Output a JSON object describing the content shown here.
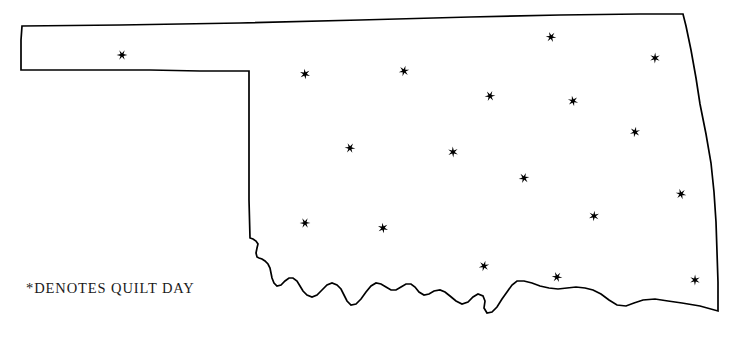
{
  "map": {
    "title": "Oklahoma Quilt Day Map",
    "state_name": "Oklahoma",
    "outline_color": "#000000",
    "background_color": "#ffffff",
    "marker_symbol": "*",
    "marker_color": "#000000",
    "marker_count": 18,
    "markers": [
      {
        "label": "quilt-day-site-1",
        "x": 122,
        "y": 55,
        "region": "panhandle"
      },
      {
        "label": "quilt-day-site-2",
        "x": 305,
        "y": 74,
        "region": "northwest"
      },
      {
        "label": "quilt-day-site-3",
        "x": 404,
        "y": 71,
        "region": "north-central"
      },
      {
        "label": "quilt-day-site-4",
        "x": 551,
        "y": 37,
        "region": "north"
      },
      {
        "label": "quilt-day-site-5",
        "x": 655,
        "y": 58,
        "region": "northeast"
      },
      {
        "label": "quilt-day-site-6",
        "x": 490,
        "y": 96,
        "region": "north-central"
      },
      {
        "label": "quilt-day-site-7",
        "x": 573,
        "y": 101,
        "region": "northeast"
      },
      {
        "label": "quilt-day-site-8",
        "x": 635,
        "y": 132,
        "region": "east"
      },
      {
        "label": "quilt-day-site-9",
        "x": 350,
        "y": 148,
        "region": "west-central"
      },
      {
        "label": "quilt-day-site-10",
        "x": 453,
        "y": 152,
        "region": "central"
      },
      {
        "label": "quilt-day-site-11",
        "x": 524,
        "y": 178,
        "region": "central"
      },
      {
        "label": "quilt-day-site-12",
        "x": 681,
        "y": 194,
        "region": "southeast"
      },
      {
        "label": "quilt-day-site-13",
        "x": 594,
        "y": 216,
        "region": "southeast"
      },
      {
        "label": "quilt-day-site-14",
        "x": 305,
        "y": 223,
        "region": "southwest"
      },
      {
        "label": "quilt-day-site-15",
        "x": 383,
        "y": 228,
        "region": "south-central"
      },
      {
        "label": "quilt-day-site-16",
        "x": 484,
        "y": 266,
        "region": "south"
      },
      {
        "label": "quilt-day-site-17",
        "x": 557,
        "y": 277,
        "region": "south"
      },
      {
        "label": "quilt-day-site-18",
        "x": 695,
        "y": 280,
        "region": "southeast-corner"
      }
    ]
  },
  "legend": {
    "caption": "*DENOTES QUILT DAY",
    "symbol": "*",
    "text": "DENOTES QUILT DAY"
  }
}
